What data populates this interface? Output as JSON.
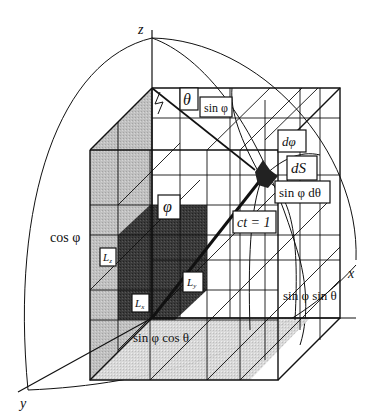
{
  "figure": {
    "type": "3D spherical-coordinate light-cone lattice diagram",
    "axes": {
      "x": "x",
      "y": "y",
      "z": "z"
    },
    "labels": {
      "theta": "θ",
      "sin_phi": "sin φ",
      "d_phi": "dφ",
      "dS": "dS",
      "sin_phi_dtheta": "sin φ dθ",
      "ct": "ct = 1",
      "phi": "φ",
      "cos_phi": "cos φ",
      "Lz": "L",
      "Lz_sub": "z",
      "Ly": "L",
      "Ly_sub": "y",
      "Lx": "L",
      "Lx_sub": "x",
      "sin_phi_sin_theta": "sin φ sin θ",
      "sin_phi_cos_theta": "sin φ cos θ"
    },
    "colors": {
      "line": "#111111",
      "dark_cube": "#333333",
      "light_shade": "#bdbdbd",
      "mid_shade": "#9a9a9a",
      "background": "#ffffff"
    }
  }
}
